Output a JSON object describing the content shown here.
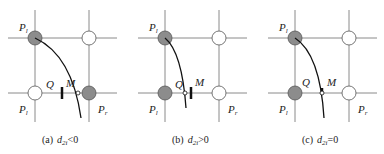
{
  "colors": {
    "grid": "#8a8a8a",
    "filled_circle": "#8c8c8c",
    "open_circle": "#ffffff",
    "curve": "#111111",
    "text": "#222222"
  },
  "panels": [
    {
      "id": "a",
      "caption_prefix": "(a)",
      "caption_var": "d",
      "caption_sub": "2i",
      "caption_rel": "<0",
      "labels": {
        "top_left": "P",
        "top_left_sub": "l",
        "bottom_left": "P",
        "bottom_left_sub": "l",
        "bottom_right": "P",
        "bottom_right_sub": "r",
        "q": "Q",
        "m": "M"
      },
      "points": {
        "top_left": "filled",
        "top_right": "open",
        "bottom_left": "open",
        "bottom_right": "filled"
      }
    },
    {
      "id": "b",
      "caption_prefix": "(b)",
      "caption_var": "d",
      "caption_sub": "2i",
      "caption_rel": ">0",
      "labels": {
        "top_left": "P",
        "top_left_sub": "l",
        "bottom_left": "P",
        "bottom_left_sub": "l",
        "bottom_right": "P",
        "bottom_right_sub": "r",
        "q": "Q",
        "m": "M"
      },
      "points": {
        "top_left": "filled",
        "top_right": "open",
        "bottom_left": "filled",
        "bottom_right": "open"
      }
    },
    {
      "id": "c",
      "caption_prefix": "(c)",
      "caption_var": "d",
      "caption_sub": "2i",
      "caption_rel": "=0",
      "labels": {
        "top_left": "P",
        "top_left_sub": "l",
        "bottom_left": "P",
        "bottom_left_sub": "l",
        "bottom_right": "P",
        "bottom_right_sub": "r",
        "q": "Q",
        "m": "M"
      },
      "points": {
        "top_left": "filled",
        "top_right": "open",
        "bottom_left": "filled",
        "bottom_right": "open"
      }
    }
  ]
}
